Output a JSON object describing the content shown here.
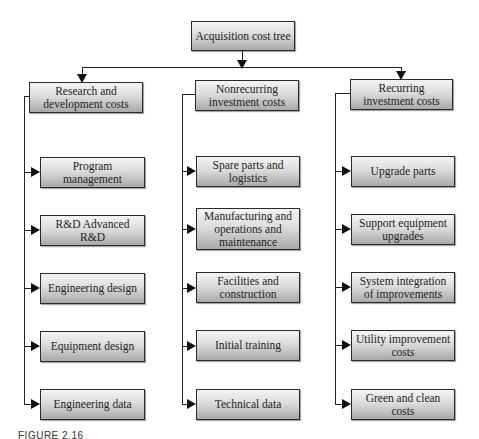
{
  "diagram": {
    "type": "tree",
    "root": {
      "label": "Acquisition cost tree"
    },
    "branches": [
      {
        "label": "Research and development costs",
        "label_lines": [
          "Research and",
          "development costs"
        ],
        "children": [
          "Program management",
          "R&D Advanced R&D",
          "Engineering design",
          "Equipment design",
          "Engineering data"
        ]
      },
      {
        "label": "Nonrecurring investment costs",
        "label_lines": [
          "Nonrecurring",
          "investment costs"
        ],
        "children": [
          "Spare parts and logistics",
          "Manufacturing and operations and maintenance",
          "Facilities and construction",
          "Initial training",
          "Technical data"
        ]
      },
      {
        "label": "Recurring investment costs",
        "label_lines": [
          "Recurring",
          "investment costs"
        ],
        "children": [
          "Upgrade parts",
          "Support equipment upgrades",
          "System integration of improvements",
          "Utility improvement costs",
          "Green and clean costs"
        ]
      }
    ]
  },
  "caption": "FIGURE 2.16"
}
